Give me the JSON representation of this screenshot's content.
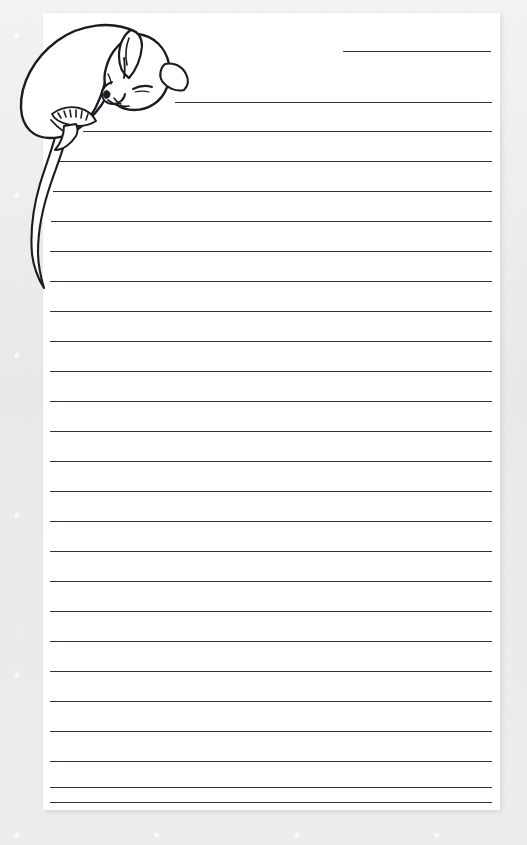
{
  "document": {
    "kind": "lined-stationery-sheet",
    "title": "Sleeping Mouse Writing Paper",
    "orientation": "portrait"
  },
  "canvas": {
    "width": 527,
    "height": 845,
    "background_color": "#ededed",
    "background_texture": "mottled light gray paper"
  },
  "paper": {
    "left": 43,
    "top": 13,
    "width": 457,
    "height": 797,
    "color": "#ffffff",
    "shadow_color": "rgba(0,0,0,0.09)"
  },
  "illustration": {
    "name": "sleeping-mouse",
    "description": "line drawing of a curled sleeping mouse resting its head on the first ruled line, with a long curving tail hanging down the left margin",
    "stroke_color": "#1b1c20",
    "fill_color": "#ffffff",
    "parts": [
      "body",
      "head",
      "ear",
      "closed-eye",
      "snout",
      "front-paw",
      "hind-foot",
      "tail"
    ]
  },
  "rules": {
    "color": "#2f3136",
    "thickness_px": 1.6,
    "left_x": 50,
    "right_x": 492,
    "short_line_left_x": 343,
    "spacing_px": 30,
    "count": 26,
    "lines": [
      {
        "index": 1,
        "y": 51,
        "x1": 343,
        "x2": 491,
        "short": true
      },
      {
        "index": 2,
        "y": 102,
        "x1": 175,
        "x2": 492,
        "short": true
      },
      {
        "index": 3,
        "y": 131,
        "x1": 83,
        "x2": 492,
        "short": true
      },
      {
        "index": 4,
        "y": 161,
        "x1": 57,
        "x2": 492,
        "short": false
      },
      {
        "index": 5,
        "y": 191,
        "x1": 53,
        "x2": 492,
        "short": false
      },
      {
        "index": 6,
        "y": 221,
        "x1": 51,
        "x2": 492,
        "short": false
      },
      {
        "index": 7,
        "y": 251,
        "x1": 50,
        "x2": 492,
        "short": false
      },
      {
        "index": 8,
        "y": 281,
        "x1": 50,
        "x2": 492,
        "short": false
      },
      {
        "index": 9,
        "y": 311,
        "x1": 50,
        "x2": 492,
        "short": false
      },
      {
        "index": 10,
        "y": 341,
        "x1": 50,
        "x2": 492,
        "short": false
      },
      {
        "index": 11,
        "y": 371,
        "x1": 50,
        "x2": 492,
        "short": false
      },
      {
        "index": 12,
        "y": 401,
        "x1": 50,
        "x2": 492,
        "short": false
      },
      {
        "index": 13,
        "y": 431,
        "x1": 50,
        "x2": 492,
        "short": false
      },
      {
        "index": 14,
        "y": 461,
        "x1": 50,
        "x2": 492,
        "short": false
      },
      {
        "index": 15,
        "y": 491,
        "x1": 50,
        "x2": 492,
        "short": false
      },
      {
        "index": 16,
        "y": 521,
        "x1": 50,
        "x2": 492,
        "short": false
      },
      {
        "index": 17,
        "y": 551,
        "x1": 50,
        "x2": 492,
        "short": false
      },
      {
        "index": 18,
        "y": 581,
        "x1": 50,
        "x2": 492,
        "short": false
      },
      {
        "index": 19,
        "y": 611,
        "x1": 50,
        "x2": 492,
        "short": false
      },
      {
        "index": 20,
        "y": 641,
        "x1": 50,
        "x2": 492,
        "short": false
      },
      {
        "index": 21,
        "y": 671,
        "x1": 50,
        "x2": 492,
        "short": false
      },
      {
        "index": 22,
        "y": 701,
        "x1": 50,
        "x2": 492,
        "short": false
      },
      {
        "index": 23,
        "y": 731,
        "x1": 50,
        "x2": 492,
        "short": false
      },
      {
        "index": 24,
        "y": 761,
        "x1": 50,
        "x2": 492,
        "short": false
      },
      {
        "index": 25,
        "y": 787,
        "x1": 50,
        "x2": 492,
        "short": false
      },
      {
        "index": 26,
        "y": 802,
        "x1": 50,
        "x2": 492,
        "short": false
      }
    ]
  },
  "writing_area": {
    "placeholder": "",
    "value": ""
  }
}
